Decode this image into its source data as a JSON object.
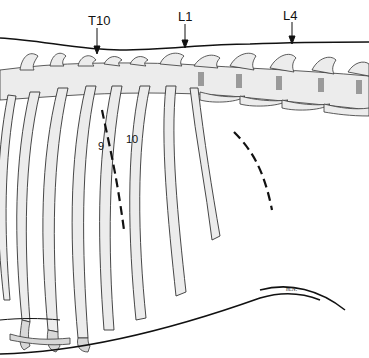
{
  "labels": {
    "vertebra_t10": "T10",
    "vertebra_l1": "L1",
    "vertebra_l4": "L4",
    "rib_9": "9",
    "rib_10": "10",
    "signature": "m.N."
  },
  "colors": {
    "line": "#111111",
    "bone_fill": "#ececec",
    "bone_shade": "#d8d8d8",
    "disc": "#9a9a9a"
  }
}
